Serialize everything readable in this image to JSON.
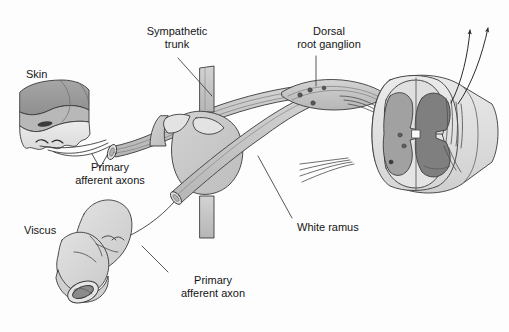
{
  "figure": {
    "type": "anatomical-diagram",
    "background_color": "#fdfdfd",
    "line_color": "#3a3a3a",
    "palette": {
      "skin_dark": "#9a9a9a",
      "skin_light": "#e2e2e2",
      "nerve_gray": "#c9c9c9",
      "ganglion_gray": "#c2c2c2",
      "cord_white_matter": "#dedede",
      "cord_gray_matter": "#9f9f9f",
      "cord_dorsal_horn": "#848484",
      "viscus_gray": "#d8d8d8",
      "text": "#151515"
    }
  },
  "labels": [
    {
      "id": "skin",
      "text": "Skin",
      "x": 26,
      "y": 68,
      "align": "left"
    },
    {
      "id": "sympathetic-trunk",
      "text": "Sympathetic\ntrunk",
      "x": 139,
      "y": 25,
      "align": "center"
    },
    {
      "id": "dorsal-root-ganglion",
      "text": "Dorsal\nroot ganglion",
      "x": 289,
      "y": 25,
      "align": "center"
    },
    {
      "id": "primary-afferent-axons",
      "text": "Primary\nafferent axons",
      "x": 60,
      "y": 161,
      "align": "center"
    },
    {
      "id": "viscus",
      "text": "Viscus",
      "x": 24,
      "y": 224,
      "align": "left"
    },
    {
      "id": "white-ramus",
      "text": "White ramus",
      "x": 297,
      "y": 221,
      "align": "left"
    },
    {
      "id": "primary-afferent-axon",
      "text": "Primary\nafferent axon",
      "x": 166,
      "y": 274,
      "align": "center"
    }
  ],
  "leader_lines": [
    {
      "id": "leader-sympathetic-trunk",
      "from": [
        178,
        58
      ],
      "to": [
        212,
        96
      ]
    },
    {
      "id": "leader-dorsal-root-ganglion",
      "from": [
        316,
        56
      ],
      "to": [
        316,
        86
      ]
    },
    {
      "id": "leader-white-ramus",
      "from": [
        292,
        218
      ],
      "to": [
        258,
        156
      ]
    },
    {
      "id": "leader-primary-afferent-axon",
      "from": [
        168,
        272
      ],
      "to": [
        142,
        246
      ]
    }
  ],
  "structures": [
    {
      "id": "skin-block",
      "name": "skin",
      "description": "cut block of skin with epidermis and dermis"
    },
    {
      "id": "viscus-tube",
      "name": "viscus",
      "description": "cut loop of hollow viscus"
    },
    {
      "id": "spinal-nerve",
      "name": "spinal-nerve",
      "description": "cut spinal nerve trunk running to the cord"
    },
    {
      "id": "sympathetic-trunk",
      "name": "sympathetic-trunk",
      "description": "vertical paravertebral sympathetic trunk"
    },
    {
      "id": "sympathetic-ganglion",
      "name": "sympathetic-ganglion",
      "description": "bulbous paravertebral ganglion"
    },
    {
      "id": "white-ramus",
      "name": "white-ramus",
      "description": "white ramus communicans"
    },
    {
      "id": "dorsal-root-ganglion",
      "name": "dorsal-root-ganglion",
      "description": "dorsal root ganglion containing cell bodies"
    },
    {
      "id": "spinal-cord",
      "name": "spinal-cord",
      "description": "two cut segments of spinal cord with gray matter"
    },
    {
      "id": "ascending-arrows",
      "name": "ascending-tract-arrows",
      "count": 2,
      "description": "two arrows showing ascending projections"
    }
  ]
}
